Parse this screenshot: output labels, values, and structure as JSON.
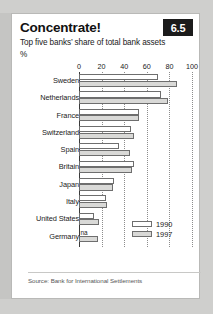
{
  "card": {
    "badge": "6.5",
    "title": "Concentrate!",
    "subtitle": "Top five banks’ share of total bank assets",
    "unit": "%",
    "source": "Source: Bank for International Settlements"
  },
  "legend": {
    "items": [
      {
        "label": "1990",
        "key": "y1990",
        "color": "#ffffff"
      },
      {
        "label": "1997",
        "key": "y1997",
        "color": "#d9d9d7"
      }
    ]
  },
  "chart_data": {
    "type": "bar",
    "orientation": "horizontal",
    "title": "Concentrate!",
    "subtitle": "Top five banks’ share of total bank assets",
    "xlabel": "%",
    "ylabel": "",
    "xlim": [
      0,
      100
    ],
    "xticks": [
      0,
      20,
      40,
      60,
      80,
      100
    ],
    "xtick_labels": [
      "0",
      "20",
      "40",
      "60",
      "80",
      "100"
    ],
    "grid": "vertical-dotted",
    "legend_position": "bottom-right",
    "categories": [
      "Sweden",
      "Netherlands",
      "France",
      "Switzerland",
      "Spain",
      "Britain",
      "Japan",
      "Italy",
      "United States",
      "Germany"
    ],
    "series": [
      {
        "name": "1990",
        "color": "#ffffff",
        "values": [
          70,
          73,
          53,
          46,
          35,
          49,
          31,
          24,
          13,
          null
        ],
        "value_labels": [
          "",
          "",
          "",
          "",
          "",
          "",
          "",
          "",
          "",
          "na"
        ]
      },
      {
        "name": "1997",
        "color": "#d9d9d7",
        "values": [
          87,
          79,
          53,
          49,
          45,
          47,
          30,
          25,
          18,
          17
        ],
        "value_labels": [
          "",
          "",
          "",
          "",
          "",
          "",
          "",
          "",
          "",
          ""
        ]
      }
    ],
    "source": "Bank for International Settlements"
  }
}
